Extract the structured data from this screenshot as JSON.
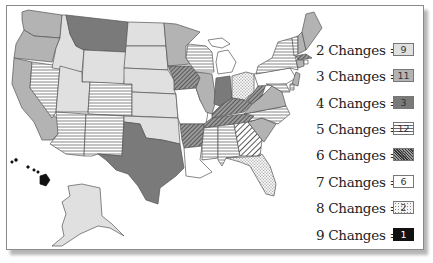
{
  "map": {
    "title": "",
    "region": "United States"
  },
  "legend": {
    "items": [
      {
        "label": "2 Changes =",
        "count": "9",
        "pattern": "light-gray",
        "color": "#e0e0e0"
      },
      {
        "label": "3 Changes =",
        "count": "11",
        "pattern": "medium-gray",
        "color": "#b3b3b3"
      },
      {
        "label": "4 Changes =",
        "count": "3",
        "pattern": "dark-gray",
        "color": "#7a7a7a"
      },
      {
        "label": "5 Changes =",
        "count": "12",
        "pattern": "horizontal-lines",
        "color": "#ffffff"
      },
      {
        "label": "6 Changes =",
        "count": "6",
        "pattern": "diagonal-dense",
        "color": "#777777"
      },
      {
        "label": "7 Changes =",
        "count": "6",
        "pattern": "white",
        "color": "#ffffff"
      },
      {
        "label": "8 Changes =",
        "count": "2",
        "pattern": "dotted",
        "color": "#f2f2f2"
      },
      {
        "label": "9 Changes =",
        "count": "1",
        "pattern": "black",
        "color": "#111111"
      }
    ]
  },
  "states": {
    "2": [
      "ID",
      "WY",
      "ND",
      "SD",
      "NE",
      "KS",
      "OK",
      "UT",
      "AK"
    ],
    "3": [
      "WA",
      "OR",
      "CA",
      "MN",
      "IL",
      "VA",
      "SC",
      "NH",
      "ME",
      "CT",
      "NJ"
    ],
    "4": [
      "MT",
      "TX",
      "IN"
    ],
    "5": [
      "NV",
      "AZ",
      "NM",
      "CO",
      "WI",
      "NY",
      "NC",
      "MS",
      "AL",
      "MD",
      "VT",
      "DE"
    ],
    "6": [
      "IA",
      "AR",
      "KY",
      "TN",
      "WV",
      "MA"
    ],
    "7": [
      "MO",
      "MI",
      "PA",
      "LA",
      "RI",
      "HI-outline"
    ],
    "8": [
      "OH",
      "FL"
    ],
    "9": [
      "GA",
      "HI"
    ]
  }
}
